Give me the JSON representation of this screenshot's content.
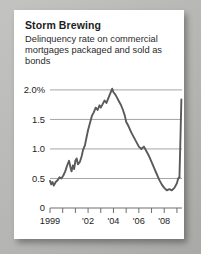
{
  "card": {
    "title": "Storm Brewing",
    "subtitle": "Delinquency rate on commercial mortgages packaged and sold as bonds"
  },
  "colors": {
    "line": "#5a5a5a",
    "gridline": "#8d8d8d",
    "axis": "#6e6e6e",
    "card_background": "#ffffff",
    "page_background": "#b9b9b7",
    "text": "#1c1c1c"
  },
  "chart_data": {
    "type": "line",
    "title": "Storm Brewing",
    "subtitle": "Delinquency rate on commercial mortgages packaged and sold as bonds",
    "xlabel": "",
    "ylabel": "",
    "xlim": [
      1999,
      2009.4
    ],
    "ylim": [
      0,
      2.1
    ],
    "grid": true,
    "legend": false,
    "ytick_labels": [
      "2.0%",
      "1.5",
      "1.0",
      "0.5",
      "0"
    ],
    "ytick_values": [
      2.0,
      1.5,
      1.0,
      0.5,
      0
    ],
    "xtick_values": [
      1999,
      2000,
      2001,
      2002,
      2003,
      2004,
      2005,
      2006,
      2007,
      2008,
      2009
    ],
    "xtick_labels": [
      "1999",
      "",
      "",
      "'02",
      "",
      "'04",
      "",
      "'06",
      "",
      "'08",
      ""
    ],
    "series": [
      {
        "name": "Delinquency rate",
        "units": "percent",
        "x": [
          1999.0,
          1999.1,
          1999.2,
          1999.3,
          1999.45,
          1999.6,
          1999.75,
          1999.9,
          2000.05,
          2000.2,
          2000.35,
          2000.5,
          2000.6,
          2000.7,
          2000.8,
          2000.9,
          2001.0,
          2001.1,
          2001.2,
          2001.35,
          2001.5,
          2001.6,
          2001.75,
          2001.9,
          2002.0,
          2002.15,
          2002.3,
          2002.45,
          2002.6,
          2002.75,
          2002.9,
          2003.0,
          2003.15,
          2003.3,
          2003.45,
          2003.6,
          2003.75,
          2003.9,
          2004.0,
          2004.15,
          2004.3,
          2004.45,
          2004.6,
          2004.75,
          2004.9,
          2005.0,
          2005.2,
          2005.4,
          2005.6,
          2005.8,
          2006.0,
          2006.2,
          2006.4,
          2006.6,
          2006.8,
          2007.0,
          2007.2,
          2007.4,
          2007.6,
          2007.8,
          2008.0,
          2008.2,
          2008.4,
          2008.6,
          2008.8,
          2009.0,
          2009.1,
          2009.2
        ],
        "y": [
          0.46,
          0.4,
          0.44,
          0.38,
          0.44,
          0.47,
          0.52,
          0.5,
          0.55,
          0.62,
          0.72,
          0.8,
          0.7,
          0.62,
          0.72,
          0.66,
          0.8,
          0.84,
          0.74,
          0.78,
          0.88,
          0.98,
          1.06,
          1.22,
          1.32,
          1.44,
          1.56,
          1.62,
          1.7,
          1.66,
          1.74,
          1.7,
          1.76,
          1.82,
          1.78,
          1.86,
          1.94,
          2.02,
          1.96,
          1.92,
          1.86,
          1.8,
          1.74,
          1.66,
          1.56,
          1.46,
          1.38,
          1.28,
          1.2,
          1.12,
          1.04,
          1.0,
          1.04,
          0.96,
          0.88,
          0.78,
          0.68,
          0.58,
          0.48,
          0.4,
          0.34,
          0.3,
          0.32,
          0.3,
          0.34,
          0.42,
          0.5,
          0.52
        ]
      },
      {
        "name": "Delinquency rate spike",
        "units": "percent",
        "x": [
          2009.2,
          2009.28,
          2009.35
        ],
        "y": [
          0.52,
          1.2,
          1.84
        ]
      }
    ],
    "annotations": [
      {
        "label": "peak",
        "x": 2003.9,
        "y": 2.02
      },
      {
        "label": "trough",
        "x": 2008.4,
        "y": 0.3
      },
      {
        "label": "final spike",
        "x": 2009.35,
        "y": 1.84
      }
    ]
  }
}
